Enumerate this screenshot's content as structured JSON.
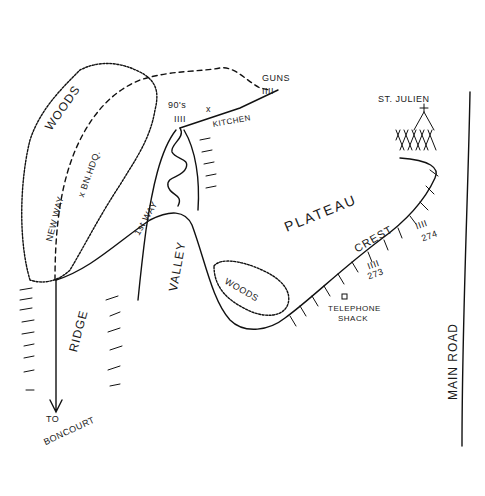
{
  "map": {
    "labels": {
      "woods_north": "WOODS",
      "bn_hdq": "x BN.HDQ.",
      "new_way": "NEW WAY",
      "first_way": "1st WAY",
      "nineties": "90's",
      "guns": "GUNS",
      "kitchen": "KITCHEN",
      "kitchen_marker": "x",
      "st_julien": "ST. JULIEN",
      "plateau": "PLATEAU",
      "crest": "CREST",
      "pos_273": "273",
      "pos_274": "274",
      "woods_south": "WOODS",
      "telephone_shack": "TELEPHONE",
      "telephone_shack_2": "SHACK",
      "ridge": "RIDGE",
      "valley": "VALLEY",
      "to_boncourt_1": "TO",
      "to_boncourt_2": "BONCOURT",
      "main_road": "MAIN ROAD",
      "unit_marks": "IIII"
    }
  }
}
